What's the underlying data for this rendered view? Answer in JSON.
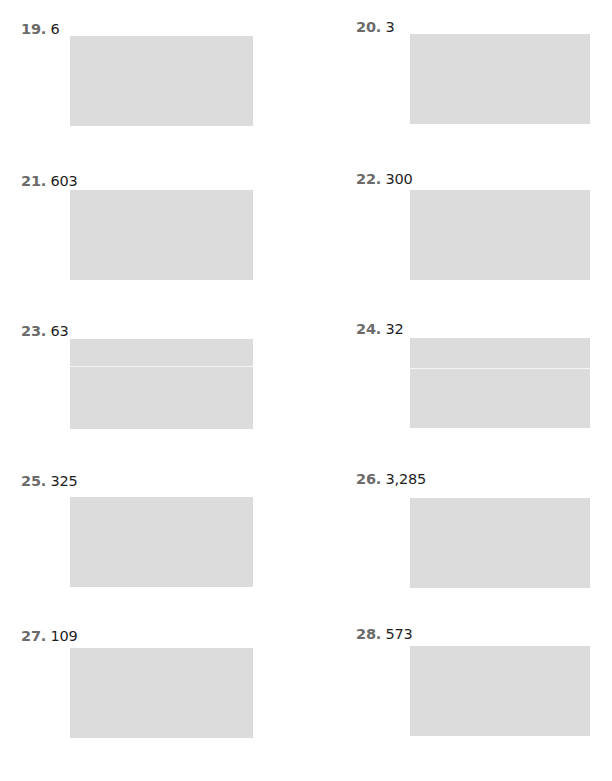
{
  "worksheet": {
    "problems": [
      {
        "number": "19.",
        "value": "6",
        "divided": false
      },
      {
        "number": "20.",
        "value": "3",
        "divided": false
      },
      {
        "number": "21.",
        "value": "603",
        "divided": false
      },
      {
        "number": "22.",
        "value": "300",
        "divided": false
      },
      {
        "number": "23.",
        "value": "63",
        "divided": true
      },
      {
        "number": "24.",
        "value": "32",
        "divided": true
      },
      {
        "number": "25.",
        "value": "325",
        "divided": false
      },
      {
        "number": "26.",
        "value": "3,285",
        "divided": false
      },
      {
        "number": "27.",
        "value": "109",
        "divided": false
      },
      {
        "number": "28.",
        "value": "573",
        "divided": false
      }
    ],
    "colors": {
      "number_label": "#6b6b6b",
      "value_text": "#1e1e1e",
      "answer_box": "#dcdcdc",
      "background": "#ffffff"
    }
  }
}
